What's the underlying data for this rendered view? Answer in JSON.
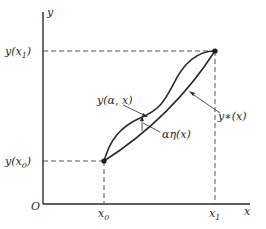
{
  "diagram": {
    "axes": {
      "y_axis_label": "y",
      "x_axis_label": "x",
      "origin_label": "O"
    },
    "ticks": {
      "x0": "x",
      "x0_sub": "0",
      "x1": "x",
      "x1_sub": "1",
      "y_x0_prefix": "y(x",
      "y_x0_sub": "0",
      "y_x0_suffix": ")",
      "y_x1_prefix": "y(x",
      "y_x1_sub": "1",
      "y_x1_suffix": ")"
    },
    "curves": {
      "varied_curve_label": "y(α, x)",
      "extremal_curve_label": "y∗(x)",
      "variation_label": "αη(x)"
    }
  }
}
